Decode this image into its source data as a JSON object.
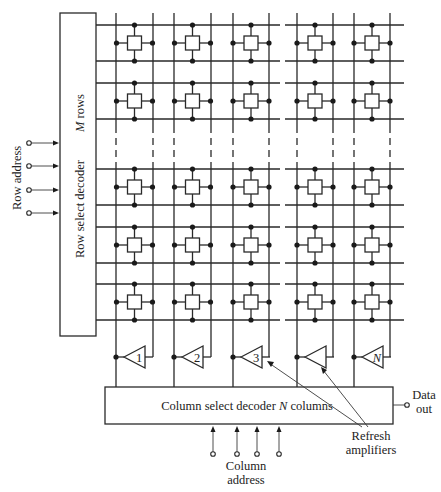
{
  "diagram": {
    "row_decoder": {
      "label": "Row select decoder",
      "rows_label_var": "M",
      "rows_label_text": " rows"
    },
    "row_address": {
      "label": "Row address",
      "inputs": 4
    },
    "column_decoder": {
      "label_prefix": "Column select decoder ",
      "label_var": "N",
      "label_suffix": " columns"
    },
    "column_address": {
      "label_line1": "Column",
      "label_line2": "address",
      "inputs": 4
    },
    "data_out": {
      "label_line1": "Data",
      "label_line2": "out"
    },
    "refresh_amplifiers": {
      "label_line1": "Refresh",
      "label_line2": "amplifiers"
    },
    "amplifiers": [
      {
        "label": "1",
        "italic": false
      },
      {
        "label": "2",
        "italic": false
      },
      {
        "label": "3",
        "italic": false
      },
      {
        "label": "",
        "italic": false
      },
      {
        "label": "N",
        "italic": true
      }
    ],
    "grid": {
      "visible_columns": 5,
      "visible_rows": 5,
      "column_ellipsis_between": [
        3,
        4
      ],
      "row_ellipsis_between": [
        2,
        3
      ]
    }
  }
}
